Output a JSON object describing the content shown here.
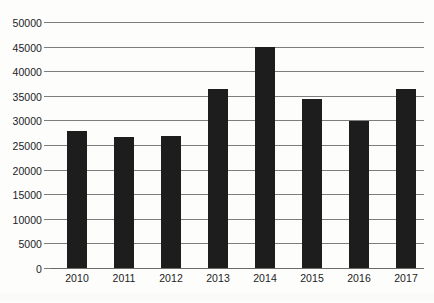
{
  "chart_data": {
    "type": "bar",
    "title": "",
    "xlabel": "",
    "ylabel": "",
    "categories": [
      "2010",
      "2011",
      "2012",
      "2013",
      "2014",
      "2015",
      "2016",
      "2017"
    ],
    "values": [
      27800,
      26600,
      26900,
      36300,
      45000,
      34400,
      29900,
      36400
    ],
    "ylim": [
      0,
      50000
    ],
    "y_ticks": [
      0,
      5000,
      10000,
      15000,
      20000,
      25000,
      30000,
      35000,
      40000,
      45000,
      50000
    ],
    "y_tick_labels": [
      "0",
      "5000",
      "10000",
      "15000",
      "20000",
      "25000",
      "30000",
      "35000",
      "40000",
      "45000",
      "50000"
    ],
    "grid": true,
    "legend": false,
    "legend_position": "none",
    "series": [
      {
        "name": "",
        "values": [
          27800,
          26600,
          26900,
          36300,
          45000,
          34400,
          29900,
          36400
        ]
      }
    ],
    "colors": {
      "bar": "#1d1d1d",
      "gridline": "#7d7d7d",
      "background": "#fdfdfc",
      "text": "#1c1c1c"
    }
  }
}
